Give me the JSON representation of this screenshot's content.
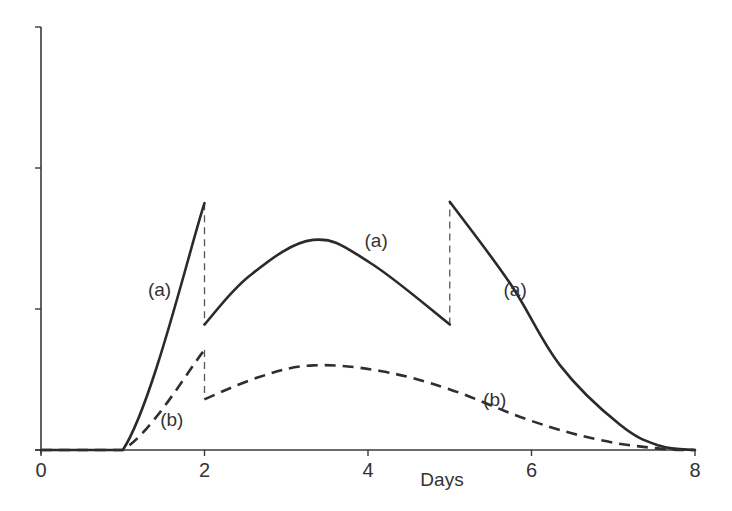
{
  "chart_data": {
    "type": "line",
    "title": "",
    "xlabel": "Days",
    "ylabel": "",
    "xlim": [
      0,
      8
    ],
    "ylim": [
      0,
      3
    ],
    "x_ticks": [
      0,
      2,
      4,
      6,
      8
    ],
    "x_tick_labels": [
      "0",
      "2",
      "4",
      "6",
      "8"
    ],
    "y_ticks": [
      0,
      1,
      2,
      3
    ],
    "y_tick_labels": [
      "",
      "",
      "",
      ""
    ],
    "grid": false,
    "legend": null,
    "series": [
      {
        "name": "(a)",
        "style": "solid",
        "x": [
          0,
          1.0,
          2.0,
          2.0,
          2.56,
          3.33,
          4.02,
          5.0,
          5.0,
          5.74,
          6.35,
          7.08,
          7.57,
          8.0
        ],
        "values": [
          0,
          0,
          1.75,
          0.89,
          1.24,
          1.49,
          1.33,
          0.89,
          1.76,
          1.18,
          0.6,
          0.18,
          0.03,
          0
        ]
      },
      {
        "name": "(b)",
        "style": "dashed",
        "x": [
          0,
          1.0,
          2.0,
          2.0,
          2.68,
          3.33,
          4.15,
          5.0,
          5.98,
          6.84,
          7.57,
          8.0
        ],
        "values": [
          0,
          0,
          0.71,
          0.36,
          0.52,
          0.6,
          0.56,
          0.43,
          0.21,
          0.07,
          0.01,
          0
        ]
      }
    ],
    "annotations": [
      {
        "text": "(a)",
        "x": 1.45,
        "y": 1.14
      },
      {
        "text": "(a)",
        "x": 4.1,
        "y": 1.49
      },
      {
        "text": "(a)",
        "x": 5.8,
        "y": 1.14
      },
      {
        "text": "(b)",
        "x": 1.6,
        "y": 0.22
      },
      {
        "text": "(b)",
        "x": 5.55,
        "y": 0.36
      }
    ],
    "drop_lines": [
      {
        "x": 2.0,
        "from": 1.75,
        "to": 0.89
      },
      {
        "x": 2.0,
        "from": 0.71,
        "to": 0.36
      },
      {
        "x": 5.0,
        "from": 0.89,
        "to": 1.76
      }
    ]
  }
}
